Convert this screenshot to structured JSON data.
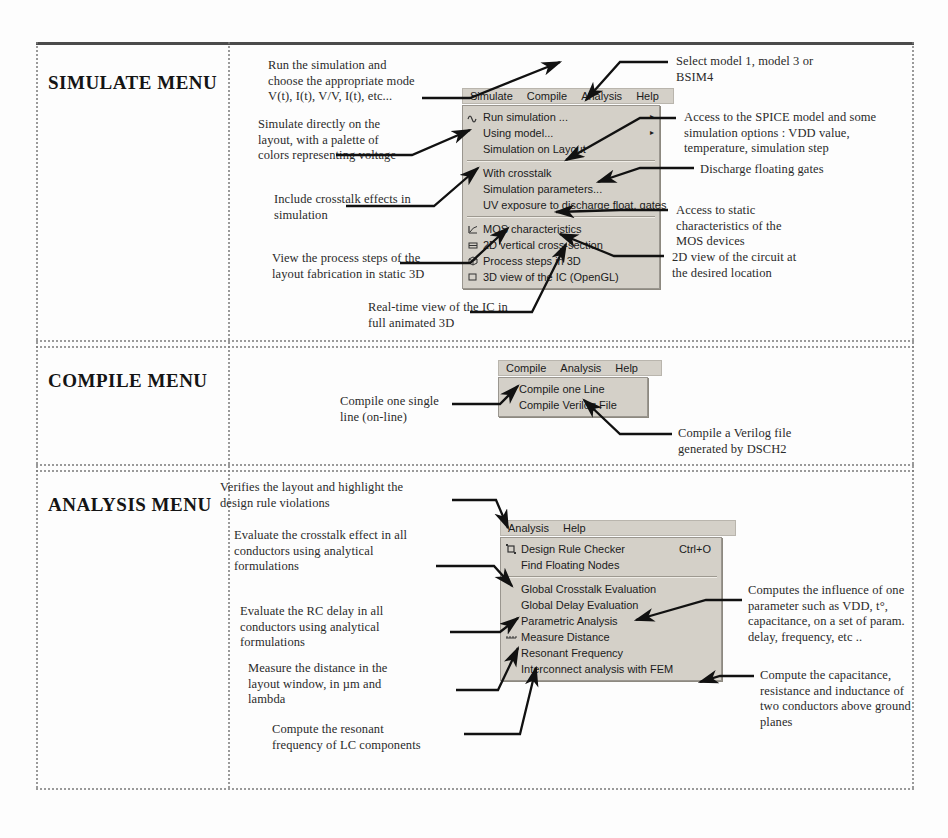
{
  "page": {
    "sections": [
      {
        "title": "SIMULATE MENU"
      },
      {
        "title": "COMPILE MENU"
      },
      {
        "title": "ANALYSIS MENU"
      }
    ]
  },
  "simulate": {
    "menubar": [
      "Simulate",
      "Compile",
      "Analysis",
      "Help"
    ],
    "items": [
      {
        "label": "Run simulation ...",
        "icon": "wave-icon",
        "submenu": "▸"
      },
      {
        "label": "Using model...",
        "icon": "",
        "submenu": "▸"
      },
      {
        "label": "Simulation on Layout",
        "icon": "",
        "submenu": ""
      },
      {
        "label": "With crosstalk",
        "icon": "",
        "submenu": ""
      },
      {
        "label": "Simulation parameters...",
        "icon": "",
        "submenu": ""
      },
      {
        "label": "UV exposure to discharge float. gates",
        "icon": "",
        "submenu": ""
      },
      {
        "label": "MOS characteristics",
        "icon": "chart-icon",
        "submenu": ""
      },
      {
        "label": "2D vertical cross-section",
        "icon": "section-icon",
        "submenu": ""
      },
      {
        "label": "Process steps in 3D",
        "icon": "cube-icon",
        "submenu": ""
      },
      {
        "label": "3D view of the IC (OpenGL)",
        "icon": "3d-icon",
        "submenu": ""
      }
    ],
    "notes": {
      "run": "Run the simulation and\nchoose the appropriate mode\nV(t), I(t), V/V, I(t), etc...",
      "layout": "Simulate directly on the\nlayout, with a palette of\ncolors representing voltage",
      "crosstalk": "Include crosstalk effects in\nsimulation",
      "process": "View the process steps of the\nlayout fabrication in static 3D",
      "realtime": "Real-time view of the IC in\nfull animated 3D",
      "model": "Select model 1, model 3 or\nBSIM4",
      "spice": "Access to the SPICE model and some\nsimulation options : VDD value,\ntemperature, simulation step",
      "discharge": "Discharge floating gates",
      "static": "Access to static\ncharacteristics of the\nMOS devices",
      "twod": "2D view of the circuit at\nthe desired location"
    }
  },
  "compile": {
    "menubar": [
      "Compile",
      "Analysis",
      "Help"
    ],
    "items": [
      {
        "label": "Compile one Line"
      },
      {
        "label": "Compile Verilog File"
      }
    ],
    "notes": {
      "oneline": "Compile one single\nline (on-line)",
      "verilog": "Compile a Verilog file\ngenerated by DSCH2"
    }
  },
  "analysis": {
    "menubar": [
      "Analysis",
      "Help"
    ],
    "items": [
      {
        "label": "Design Rule Checker",
        "accel": "Ctrl+O",
        "icon": "drc-icon"
      },
      {
        "label": "Find Floating Nodes",
        "accel": "",
        "icon": ""
      },
      {
        "label": "Global Crosstalk Evaluation",
        "accel": "",
        "icon": ""
      },
      {
        "label": "Global Delay Evaluation",
        "accel": "",
        "icon": ""
      },
      {
        "label": "Parametric Analysis",
        "accel": "",
        "icon": ""
      },
      {
        "label": "Measure Distance",
        "accel": "",
        "icon": "ruler-icon"
      },
      {
        "label": "Resonant Frequency",
        "accel": "",
        "icon": ""
      },
      {
        "label": "Interconnect analysis with FEM",
        "accel": "",
        "icon": ""
      }
    ],
    "notes": {
      "drc": "Verifies the layout and highlight the\ndesign rule violations",
      "crosstalk": "Evaluate the crosstalk  effect in all\nconductors using analytical\nformulations",
      "delay": "Evaluate the RC delay in all\nconductors using analytical\nformulations",
      "distance": "Measure the distance in the\nlayout window, in µm and\nlambda",
      "resonant": "Compute the resonant\nfrequency of LC components",
      "parametric": "Computes the influence of one\nparameter such as  VDD, t°,\ncapacitance, on a set of param.\ndelay, frequency, etc ..",
      "fem": "Compute the capacitance,\nresistance and inductance of\ntwo conductors above ground\nplanes"
    }
  }
}
